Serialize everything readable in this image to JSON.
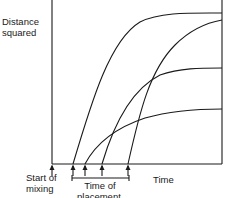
{
  "diagram": {
    "y_axis_label_line1": "Distance",
    "y_axis_label_line2": "squared",
    "x_axis_label": "Time",
    "start_label_line1": "Start of",
    "start_label_line2": "mixing",
    "placement_label_line1": "Time of",
    "placement_label_line2": "placement",
    "stroke_color": "#1a1a1a",
    "curves": [
      {
        "name": "curve-1",
        "start_x": 73,
        "plateau_y": 13
      },
      {
        "name": "curve-2",
        "start_x": 85,
        "plateau_y": 109
      },
      {
        "name": "curve-3",
        "start_x": 102,
        "plateau_y": 68
      },
      {
        "name": "curve-4",
        "start_x": 128,
        "plateau_y": 20
      }
    ],
    "arrows_x": [
      52,
      73,
      85,
      102,
      128
    ]
  }
}
